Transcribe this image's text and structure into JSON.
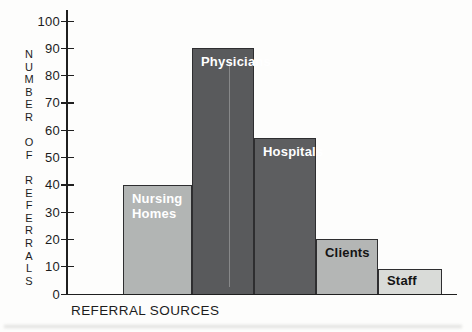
{
  "chart_data": {
    "type": "bar",
    "categories": [
      "Nursing Homes",
      "Physicians",
      "Hospitals",
      "Clients",
      "Staff"
    ],
    "values": [
      40,
      90,
      57,
      20,
      9
    ],
    "title": "",
    "xlabel": "REFERRAL SOURCES",
    "ylabel": "NUMBER OF REFERRALS",
    "ylim": [
      0,
      100
    ],
    "ytick_interval": 10,
    "y_tick_labels": [
      "100",
      "90",
      "80",
      "70",
      "60",
      "50",
      "40",
      "30",
      "20",
      "10",
      "0"
    ],
    "grid": false,
    "legend_position": "none",
    "bar_label_position": "inside-top-left",
    "bar_colors": [
      "#b2b5b4",
      "#595a5c",
      "#5d5e60",
      "#b4b6b5",
      "#d9dbd8"
    ],
    "bar_label_colors": [
      "#ffffff",
      "#ffffff",
      "#ffffff",
      "#141414",
      "#141414"
    ],
    "axis_color": "#1f1f1f"
  }
}
